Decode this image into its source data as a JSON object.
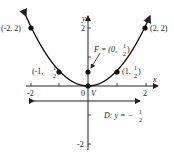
{
  "diagram": {
    "type": "parabola",
    "equation": "y = x^2 / 2",
    "axes": {
      "x_label": "x",
      "y_label": "y",
      "x_ticks": [
        "-2",
        "2"
      ],
      "y_ticks": [
        "2",
        "-2"
      ],
      "origin_label": "0"
    },
    "points": [
      {
        "label": "(-2, 2)",
        "x": -2,
        "y": 2
      },
      {
        "label_pre": "(-1, ",
        "frac_num": "1",
        "frac_den": "2",
        "label_post": ")",
        "x": -1,
        "y": 0.5
      },
      {
        "label_pre": "(1, ",
        "frac_num": "1",
        "frac_den": "2",
        "label_post": ")",
        "x": 1,
        "y": 0.5
      },
      {
        "label": "(2, 2)",
        "x": 2,
        "y": 2
      }
    ],
    "focus": {
      "label_pre": "F = (0, ",
      "frac_num": "1",
      "frac_den": "2",
      "label_post": ")",
      "x": 0,
      "y": 0.5
    },
    "vertex": {
      "label": "V",
      "x": 0,
      "y": 0
    },
    "directrix": {
      "label_pre": "D: y = −",
      "frac_num": "1",
      "frac_den": "2",
      "y": -0.5
    }
  }
}
